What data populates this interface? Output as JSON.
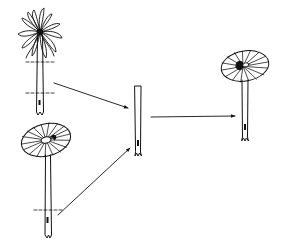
{
  "diagram": {
    "title": "",
    "colors": {
      "ink": "#111111",
      "background": "#ffffff"
    },
    "nodes": [
      {
        "id": "mushroom-shaggy",
        "kind": "mushroom-open-shaggy-cap",
        "cuts": 2
      },
      {
        "id": "mushroom-radial",
        "kind": "mushroom-radial-cap",
        "cuts": 1
      },
      {
        "id": "stem-segment",
        "kind": "excised-stem-segment"
      },
      {
        "id": "mushroom-regenerated",
        "kind": "mushroom-radial-cap-on-segment"
      }
    ],
    "edges": [
      {
        "from": "mushroom-shaggy",
        "to": "stem-segment"
      },
      {
        "from": "mushroom-radial",
        "to": "stem-segment"
      },
      {
        "from": "stem-segment",
        "to": "mushroom-regenerated"
      }
    ]
  }
}
